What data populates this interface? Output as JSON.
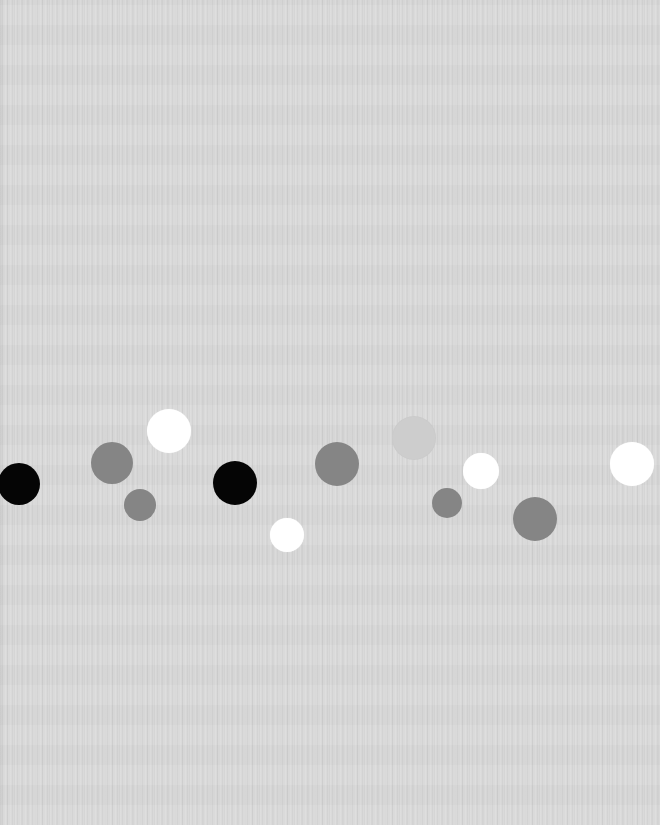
{
  "canvas": {
    "width": 660,
    "height": 825,
    "background": "#d9d9d9"
  },
  "palette": {
    "black": "#050505",
    "gray": "#858585",
    "white": "#ffffff",
    "light": "#cdcdcd"
  },
  "dots": [
    {
      "id": "dot-1",
      "cx": 19,
      "cy": 484,
      "r": 21,
      "tone": "black"
    },
    {
      "id": "dot-2",
      "cx": 112,
      "cy": 463,
      "r": 21,
      "tone": "gray"
    },
    {
      "id": "dot-3",
      "cx": 140,
      "cy": 505,
      "r": 16,
      "tone": "gray"
    },
    {
      "id": "dot-4",
      "cx": 169,
      "cy": 431,
      "r": 22,
      "tone": "white"
    },
    {
      "id": "dot-5",
      "cx": 235,
      "cy": 483,
      "r": 22,
      "tone": "black"
    },
    {
      "id": "dot-6",
      "cx": 287,
      "cy": 535,
      "r": 17,
      "tone": "white"
    },
    {
      "id": "dot-7",
      "cx": 337,
      "cy": 464,
      "r": 22,
      "tone": "gray"
    },
    {
      "id": "dot-8",
      "cx": 414,
      "cy": 438,
      "r": 22,
      "tone": "light"
    },
    {
      "id": "dot-9",
      "cx": 447,
      "cy": 503,
      "r": 15,
      "tone": "gray"
    },
    {
      "id": "dot-10",
      "cx": 481,
      "cy": 471,
      "r": 18,
      "tone": "white"
    },
    {
      "id": "dot-11",
      "cx": 535,
      "cy": 519,
      "r": 22,
      "tone": "gray"
    },
    {
      "id": "dot-12",
      "cx": 632,
      "cy": 464,
      "r": 22,
      "tone": "white"
    }
  ]
}
